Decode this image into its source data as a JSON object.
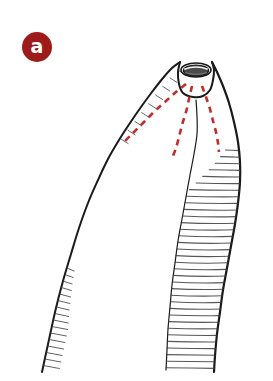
{
  "figure": {
    "panel_label": "a",
    "panel_badge_color": "#9e1b1b",
    "panel_badge_text_color": "#ffffff",
    "background_color": "#ffffff",
    "ink_color": "#1a1a1a",
    "annotation_color": "#c42b2b",
    "width": 273,
    "height": 381,
    "elements": {
      "apical_opening": "apical-oval-opening",
      "left_contour": "smooth-left-outline",
      "right_contour": "hatched-right-outline",
      "hatching": "horizontal-hatch-lines",
      "annotations": "red-dashed-guide-lines"
    }
  },
  "chart_data": {
    "type": "line",
    "title": "",
    "xlabel": "",
    "ylabel": "",
    "legend": [],
    "series": [
      {
        "name": "left-outline",
        "stroke": "#1a1a1a",
        "width": 2.0,
        "style": "solid",
        "points": [
          [
            180,
            62
          ],
          [
            172,
            68
          ],
          [
            163,
            78
          ],
          [
            152,
            92
          ],
          [
            141,
            107
          ],
          [
            130,
            123
          ],
          [
            119,
            140
          ],
          [
            108,
            159
          ],
          [
            98,
            180
          ],
          [
            88,
            203
          ],
          [
            79,
            228
          ],
          [
            71,
            254
          ],
          [
            63,
            281
          ],
          [
            56,
            308
          ],
          [
            50,
            335
          ],
          [
            45,
            358
          ],
          [
            42,
            372
          ]
        ]
      },
      {
        "name": "apex-dome-right",
        "stroke": "#1a1a1a",
        "width": 2.0,
        "style": "solid",
        "points": [
          [
            180,
            62
          ],
          [
            178,
            72
          ],
          [
            179,
            84
          ],
          [
            183,
            93
          ],
          [
            193,
            97
          ],
          [
            203,
            96
          ],
          [
            210,
            90
          ],
          [
            213,
            80
          ],
          [
            214,
            70
          ],
          [
            212,
            62
          ]
        ]
      },
      {
        "name": "right-outline",
        "stroke": "#1a1a1a",
        "width": 2.2,
        "style": "solid",
        "points": [
          [
            212,
            62
          ],
          [
            217,
            72
          ],
          [
            223,
            86
          ],
          [
            229,
            103
          ],
          [
            234,
            122
          ],
          [
            238,
            142
          ],
          [
            240,
            162
          ],
          [
            240,
            182
          ],
          [
            238,
            203
          ],
          [
            235,
            224
          ],
          [
            231,
            246
          ],
          [
            227,
            268
          ],
          [
            223,
            290
          ],
          [
            220,
            312
          ],
          [
            217,
            334
          ],
          [
            215,
            356
          ],
          [
            214,
            372
          ]
        ]
      },
      {
        "name": "inner-right-wall",
        "stroke": "#1a1a1a",
        "width": 1.2,
        "style": "solid",
        "points": [
          [
            196,
            100
          ],
          [
            197,
            116
          ],
          [
            197,
            134
          ],
          [
            194,
            154
          ],
          [
            190,
            175
          ],
          [
            186,
            197
          ],
          [
            182,
            219
          ],
          [
            178,
            241
          ],
          [
            175,
            263
          ],
          [
            172,
            285
          ],
          [
            170,
            307
          ],
          [
            168,
            329
          ],
          [
            167,
            350
          ],
          [
            166,
            370
          ]
        ]
      },
      {
        "name": "red-dash-left",
        "stroke": "#c42b2b",
        "width": 2.6,
        "style": "dashed",
        "points": [
          [
            186,
            84
          ],
          [
            176,
            92
          ],
          [
            166,
            101
          ],
          [
            156,
            110
          ],
          [
            147,
            119
          ],
          [
            138,
            128
          ],
          [
            130,
            136
          ],
          [
            124,
            142
          ]
        ]
      },
      {
        "name": "red-dash-center",
        "stroke": "#c42b2b",
        "width": 2.6,
        "style": "dashed",
        "points": [
          [
            192,
            86
          ],
          [
            189,
            99
          ],
          [
            186,
            112
          ],
          [
            182,
            125
          ],
          [
            179,
            137
          ],
          [
            176,
            148
          ],
          [
            173,
            156
          ]
        ]
      },
      {
        "name": "red-dash-right",
        "stroke": "#c42b2b",
        "width": 2.6,
        "style": "dashed",
        "points": [
          [
            202,
            86
          ],
          [
            206,
            97
          ],
          [
            210,
            109
          ],
          [
            213,
            121
          ],
          [
            216,
            132
          ],
          [
            218,
            143
          ],
          [
            219,
            152
          ]
        ]
      }
    ],
    "apical_opening": {
      "name": "apical-oval-opening",
      "cx": 196,
      "cy": 70,
      "rx": 15,
      "ry": 7,
      "fill": "#4a4a4a",
      "rings": 3
    },
    "hatching": {
      "right_wall": {
        "name": "right-wall-hatch",
        "count": 34,
        "y_start": 150,
        "y_end": 368,
        "spacing": 6.6,
        "stroke": "#3a3a3a",
        "width": 1.1
      },
      "left_wall": {
        "name": "left-wall-hatch",
        "count": 16,
        "y_start": 268,
        "y_end": 366,
        "spacing": 6.5,
        "length": 16,
        "stroke": "#3a3a3a",
        "width": 1.0
      },
      "apex_hatch": {
        "name": "apex-hatch",
        "count": 9,
        "stroke": "#3a3a3a",
        "width": 1.0
      }
    },
    "grid": false,
    "xlim": [
      0,
      273
    ],
    "ylim": [
      0,
      381
    ]
  }
}
